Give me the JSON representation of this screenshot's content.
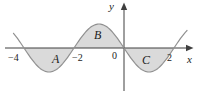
{
  "chart_data": {
    "type": "line",
    "function": "y = -sin(pi*x/2)",
    "x_range": [
      -4.42,
      2.52
    ],
    "zeros": [
      -4,
      -2,
      0,
      2
    ],
    "amplitude": 1,
    "axis_labels": {
      "x": "x",
      "y": "y"
    },
    "origin_label": "0",
    "ticks": [
      {
        "value": -4,
        "label": "−4"
      },
      {
        "value": -2,
        "label": "−2"
      },
      {
        "value": 2,
        "label": "2"
      }
    ],
    "regions": [
      {
        "label": "A",
        "from": -4,
        "to": -2,
        "position": "below-axis"
      },
      {
        "label": "B",
        "from": -2,
        "to": 0,
        "position": "above-axis"
      },
      {
        "label": "C",
        "from": 0,
        "to": 2,
        "position": "below-axis"
      }
    ],
    "colors": {
      "region_fill": "#dadada",
      "curve": "#909090",
      "axis": "#3f3f3f",
      "text": "#1c1c1c",
      "background": "#ffffff"
    },
    "grid": false,
    "legend": false
  }
}
